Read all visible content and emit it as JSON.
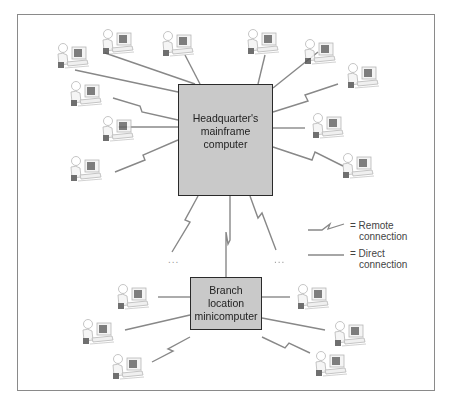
{
  "diagram": {
    "hq_node": {
      "line1": "Headquarter's",
      "line2": "mainframe",
      "line3": "computer"
    },
    "branch_node": {
      "line1": "Branch",
      "line2": "location",
      "line3": "minicomputer"
    },
    "legend": {
      "remote": {
        "symbol": "zigzag-line",
        "line1": "= Remote",
        "line2": "connection"
      },
      "direct": {
        "symbol": "straight-line",
        "line1": "= Direct",
        "line2": "connection"
      }
    },
    "ellipsis": [
      "...",
      "..."
    ],
    "colors": {
      "node_fill": "#c9c9c9",
      "node_border": "#2a2a2a",
      "line": "#888888",
      "frame": "#8a8a8a"
    },
    "terminals": {
      "hq": [
        {
          "x": 55,
          "y": 40,
          "link": "direct"
        },
        {
          "x": 90,
          "y": 22,
          "link": "direct"
        },
        {
          "x": 170,
          "y": 22,
          "link": "direct"
        },
        {
          "x": 215,
          "y": 28,
          "link": "direct"
        },
        {
          "x": 305,
          "y": 22,
          "link": "direct"
        },
        {
          "x": 340,
          "y": 48,
          "link": "direct"
        },
        {
          "x": 40,
          "y": 78,
          "link": "remote"
        },
        {
          "x": 75,
          "y": 115,
          "link": "direct"
        },
        {
          "x": 40,
          "y": 155,
          "link": "remote"
        },
        {
          "x": 345,
          "y": 78,
          "link": "remote"
        },
        {
          "x": 310,
          "y": 118,
          "link": "direct"
        },
        {
          "x": 345,
          "y": 155,
          "link": "remote"
        }
      ],
      "branch": [
        {
          "x": 95,
          "y": 280,
          "link": "direct"
        },
        {
          "x": 60,
          "y": 313,
          "link": "direct"
        },
        {
          "x": 95,
          "y": 355,
          "link": "remote"
        },
        {
          "x": 290,
          "y": 280,
          "link": "direct"
        },
        {
          "x": 325,
          "y": 313,
          "link": "direct"
        },
        {
          "x": 310,
          "y": 355,
          "link": "remote"
        }
      ]
    }
  }
}
